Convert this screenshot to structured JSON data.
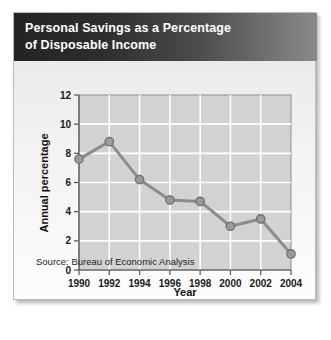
{
  "figure": {
    "title_lines": [
      "Personal Savings as a Percentage",
      "of Disposable Income"
    ],
    "source": "Source: Bureau of Economic Analysis",
    "colors": {
      "header_dark": "#232323",
      "header_light": "#8a8a8a",
      "plot_background": "#d2d2d2",
      "gridline": "#ffffff",
      "series_line": "#8c8c8c",
      "marker_fill": "#9a9a9a",
      "marker_stroke": "#6f6f6f",
      "axis": "#555555",
      "text": "#1a1a1a"
    }
  },
  "chart_data": {
    "type": "line",
    "title": "Personal Savings as a Percentage of Disposable Income",
    "xlabel": "Year",
    "ylabel": "Annual percentage",
    "categories": [
      1990,
      1992,
      1994,
      1996,
      1998,
      2000,
      2002,
      2004
    ],
    "values": [
      7.6,
      8.8,
      6.2,
      4.8,
      4.7,
      3.0,
      3.5,
      1.1
    ],
    "series": [
      {
        "name": "Personal savings rate",
        "values": [
          7.6,
          8.8,
          6.2,
          4.8,
          4.7,
          3.0,
          3.5,
          1.1
        ]
      }
    ],
    "xlim": [
      1990,
      2004
    ],
    "ylim": [
      0,
      12
    ],
    "ytick_labels": [
      "0",
      "2",
      "4",
      "6",
      "8",
      "10",
      "12"
    ],
    "yticks": [
      0,
      2,
      4,
      6,
      8,
      10,
      12
    ],
    "xtick_labels": [
      "1990",
      "1992",
      "1994",
      "1996",
      "1998",
      "2000",
      "2002",
      "2004"
    ],
    "xticks": [
      1990,
      1992,
      1994,
      1996,
      1998,
      2000,
      2002,
      2004
    ],
    "grid": true,
    "legend": false,
    "marker": "circle",
    "source_note": "Source: Bureau of Economic Analysis"
  }
}
